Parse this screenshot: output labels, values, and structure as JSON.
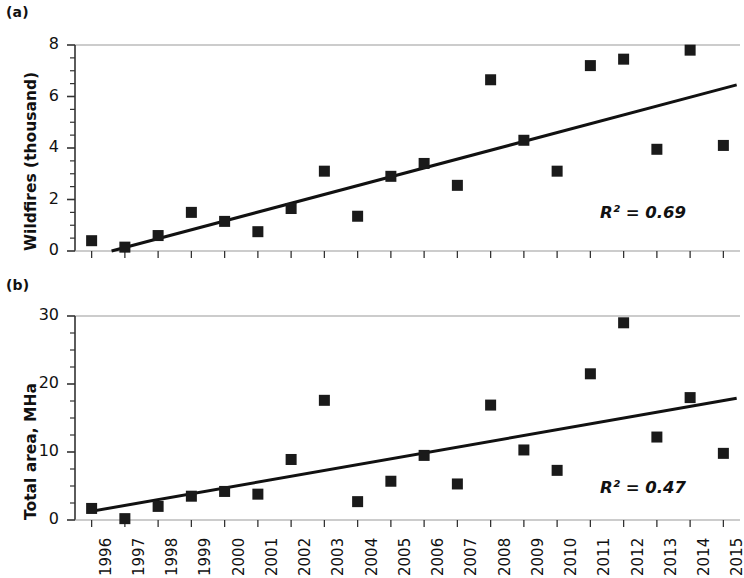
{
  "figure": {
    "panels": [
      {
        "tag": "(a)",
        "ylabel": "Wildfires (thousand)",
        "r2_text": "R² = 0.69"
      },
      {
        "tag": "(b)",
        "ylabel": "Total area, MHa",
        "r2_text": "R² = 0.47"
      }
    ]
  },
  "colors": {
    "marker": "#1a1a1a",
    "trendline": "#111111",
    "axis": "#333333",
    "gridline": "#9a9a9a",
    "background": "#ffffff",
    "text": "#111111"
  },
  "chart_data": [
    {
      "type": "scatter",
      "panel": "(a)",
      "title": "",
      "xlabel": "",
      "ylabel": "Wildfires (thousand)",
      "xlim": [
        1995.5,
        2015.5
      ],
      "ylim": [
        0,
        8
      ],
      "yticks": [
        0,
        2,
        4,
        6,
        8
      ],
      "ytick_labels": [
        "0",
        "2",
        "4",
        "6",
        "8"
      ],
      "yminor_step": 0.5,
      "grid": false,
      "top_border": true,
      "legend": "none",
      "annotations": [
        "R² = 0.69"
      ],
      "r_squared": 0.69,
      "categories": [
        1996,
        1997,
        1998,
        1999,
        2000,
        2001,
        2002,
        2003,
        2004,
        2005,
        2006,
        2007,
        2008,
        2009,
        2010,
        2011,
        2012,
        2013,
        2014,
        2015
      ],
      "x": [
        1996,
        1997,
        1998,
        1999,
        2000,
        2001,
        2002,
        2003,
        2004,
        2005,
        2006,
        2007,
        2008,
        2009,
        2010,
        2011,
        2012,
        2013,
        2014,
        2015
      ],
      "values": [
        0.4,
        0.15,
        0.6,
        1.5,
        1.15,
        0.75,
        1.65,
        3.1,
        1.35,
        2.9,
        3.4,
        2.55,
        6.65,
        4.3,
        3.1,
        7.2,
        7.45,
        3.95,
        7.8,
        4.1
      ],
      "trendline": {
        "x0": 1996.6,
        "y0": 0.0,
        "x1": 2015.4,
        "y1": 6.45
      }
    },
    {
      "type": "scatter",
      "panel": "(b)",
      "title": "",
      "xlabel": "",
      "ylabel": "Total area, MHa",
      "xlim": [
        1995.5,
        2015.5
      ],
      "ylim": [
        0,
        30
      ],
      "yticks": [
        0,
        10,
        20,
        30
      ],
      "ytick_labels": [
        "0",
        "10",
        "20",
        "30"
      ],
      "yminor_step": 2.5,
      "grid": false,
      "top_border": true,
      "legend": "none",
      "annotations": [
        "R² = 0.47"
      ],
      "r_squared": 0.47,
      "categories": [
        1996,
        1997,
        1998,
        1999,
        2000,
        2001,
        2002,
        2003,
        2004,
        2005,
        2006,
        2007,
        2008,
        2009,
        2010,
        2011,
        2012,
        2013,
        2014,
        2015
      ],
      "x": [
        1996,
        1997,
        1998,
        1999,
        2000,
        2001,
        2002,
        2003,
        2004,
        2005,
        2006,
        2007,
        2008,
        2009,
        2010,
        2011,
        2012,
        2013,
        2014,
        2015
      ],
      "values": [
        1.7,
        0.2,
        2.0,
        3.5,
        4.2,
        3.8,
        8.9,
        17.6,
        2.7,
        5.7,
        9.5,
        5.3,
        16.9,
        10.3,
        7.3,
        21.5,
        29.0,
        12.2,
        18.0,
        9.8
      ],
      "trendline": {
        "x0": 1995.9,
        "y0": 1.2,
        "x1": 2015.4,
        "y1": 17.9
      }
    }
  ],
  "xtick_labels": [
    "1996",
    "1997",
    "1998",
    "1999",
    "2000",
    "2001",
    "2002",
    "2003",
    "2004",
    "2005",
    "2006",
    "2007",
    "2008",
    "2009",
    "2010",
    "2011",
    "2012",
    "2013",
    "2014",
    "2015"
  ]
}
